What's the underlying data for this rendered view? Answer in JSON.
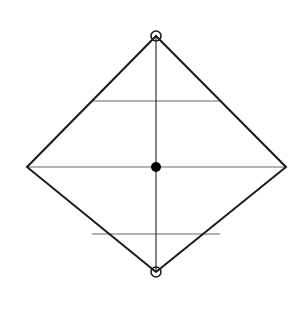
{
  "diagram": {
    "colors": {
      "outline": "#1a1a1a",
      "axis": "#333333",
      "chords": "#999999",
      "background": "#ffffff"
    },
    "vertices": {
      "top": [
        156,
        36
      ],
      "right": [
        286,
        167
      ],
      "bottom": [
        156,
        272
      ],
      "left": [
        27,
        167
      ]
    },
    "chords_y": [
      101,
      167,
      234
    ],
    "open_circles": [
      {
        "cx": 156,
        "cy": 36,
        "r": 5
      },
      {
        "cx": 156,
        "cy": 272,
        "r": 5
      }
    ],
    "center_dot": {
      "cx": 156,
      "cy": 167,
      "r": 5
    }
  }
}
